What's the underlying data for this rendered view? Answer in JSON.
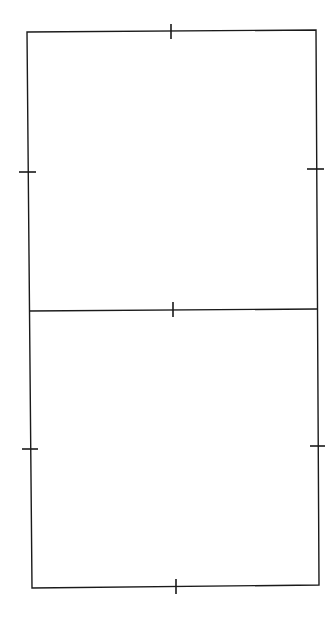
{
  "diagram": {
    "stroke_color": "#1a1a1a",
    "background": "#ffffff",
    "outline": {
      "top_left": [
        27,
        32
      ],
      "top_right": [
        316,
        30
      ],
      "bottom_right": [
        319,
        585
      ],
      "bottom_left": [
        32,
        588
      ]
    },
    "divider": {
      "left": [
        29,
        311
      ],
      "right": [
        317,
        309
      ]
    },
    "ticks": [
      {
        "name": "top-edge",
        "x1": 171,
        "y1": 24,
        "x2": 171,
        "y2": 39
      },
      {
        "name": "middle-divider",
        "x1": 173,
        "y1": 302,
        "x2": 173,
        "y2": 317
      },
      {
        "name": "bottom-edge",
        "x1": 176,
        "y1": 579,
        "x2": 176,
        "y2": 594
      },
      {
        "name": "upper-left",
        "x1": 19,
        "y1": 172,
        "x2": 36,
        "y2": 172
      },
      {
        "name": "upper-right",
        "x1": 307,
        "y1": 169,
        "x2": 324,
        "y2": 169
      },
      {
        "name": "lower-left",
        "x1": 22,
        "y1": 449,
        "x2": 38,
        "y2": 449
      },
      {
        "name": "lower-right",
        "x1": 310,
        "y1": 446,
        "x2": 325,
        "y2": 446
      }
    ]
  }
}
